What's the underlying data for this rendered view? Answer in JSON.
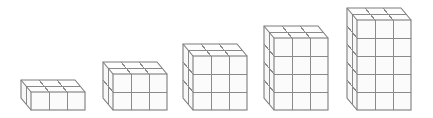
{
  "figure": {
    "description": "Sequence of five rectangular prisms built from unit cubes, each 3 cubes wide and 2 cubes deep, with heights increasing from 1 to 5 layers",
    "colors": {
      "line": "#8a8a8a",
      "outline": "#7d7d7d",
      "front_fill": "#fbfbfb",
      "top_fill": "#fdfdfd",
      "side_fill": "#f8f8f8"
    },
    "cell_size": 18,
    "depth_offset": {
      "dx": -10,
      "dy": -12
    },
    "prisms": [
      {
        "label": "prism-1",
        "width": 3,
        "depth": 2,
        "height": 1,
        "front_left_x": 31,
        "bottom_y": 110
      },
      {
        "label": "prism-2",
        "width": 3,
        "depth": 2,
        "height": 2,
        "front_left_x": 113,
        "bottom_y": 110
      },
      {
        "label": "prism-3",
        "width": 3,
        "depth": 2,
        "height": 3,
        "front_left_x": 193,
        "bottom_y": 110
      },
      {
        "label": "prism-4",
        "width": 3,
        "depth": 2,
        "height": 4,
        "front_left_x": 274,
        "bottom_y": 110
      },
      {
        "label": "prism-5",
        "width": 3,
        "depth": 2,
        "height": 5,
        "front_left_x": 357,
        "bottom_y": 110
      }
    ]
  }
}
